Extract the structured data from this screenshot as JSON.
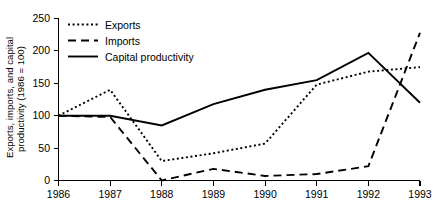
{
  "chart_data": {
    "type": "line",
    "title": "",
    "subtitle": "",
    "xlabel": "",
    "ylabel": "Exports, imports, and capital productivity (1986 = 100)",
    "x": [
      1986,
      1987,
      1988,
      1989,
      1990,
      1991,
      1992,
      1993
    ],
    "categories": [
      "1986",
      "1987",
      "1988",
      "1989",
      "1990",
      "1991",
      "1992",
      "1993"
    ],
    "xtick_labels": [
      "1986",
      "1987",
      "1988",
      "1989",
      "1990",
      "1991",
      "1992",
      "1993"
    ],
    "ytick_labels": [
      "0",
      "50",
      "100",
      "150",
      "200",
      "250"
    ],
    "ytick_values": [
      0,
      50,
      100,
      150,
      200,
      250
    ],
    "xlim": [
      1986,
      1993
    ],
    "ylim": [
      0,
      250
    ],
    "grid": false,
    "legend_position": "top-left",
    "series": [
      {
        "name": "Exports",
        "style": "dotted",
        "color": "#000000",
        "values": [
          100,
          140,
          30,
          42,
          57,
          148,
          168,
          175
        ]
      },
      {
        "name": "Imports",
        "style": "dashed",
        "color": "#000000",
        "values": [
          100,
          98,
          0,
          18,
          7,
          10,
          22,
          228
        ]
      },
      {
        "name": "Capital productivity",
        "style": "solid",
        "color": "#000000",
        "values": [
          100,
          100,
          85,
          118,
          140,
          155,
          197,
          120
        ]
      }
    ]
  },
  "legend": {
    "entries": [
      {
        "label": "Exports",
        "style": "dotted"
      },
      {
        "label": "Imports",
        "style": "dashed"
      },
      {
        "label": "Capital productivity",
        "style": "solid"
      }
    ]
  },
  "axes": {
    "y_axis_title": "Exports, imports, and capital productivity (1986 = 100)"
  }
}
